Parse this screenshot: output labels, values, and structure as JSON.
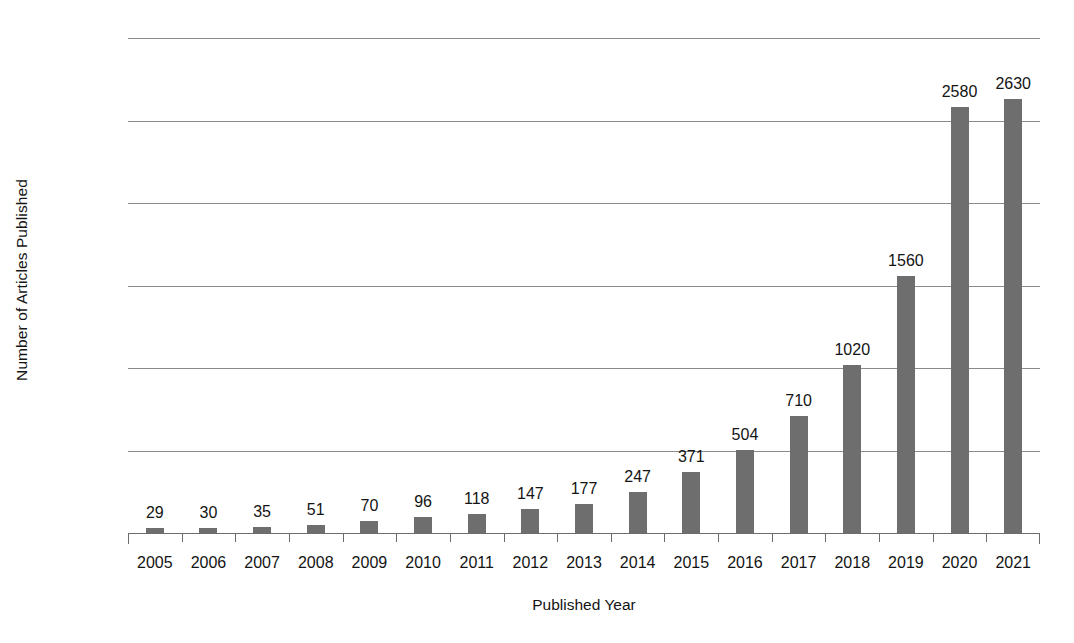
{
  "chart_data": {
    "type": "bar",
    "title": "",
    "xlabel": "Published Year",
    "ylabel": "Number of Articles Published",
    "categories": [
      "2005",
      "2006",
      "2007",
      "2008",
      "2009",
      "2010",
      "2011",
      "2012",
      "2013",
      "2014",
      "2015",
      "2016",
      "2017",
      "2018",
      "2019",
      "2020",
      "2021"
    ],
    "values": [
      29,
      30,
      35,
      51,
      70,
      96,
      118,
      147,
      177,
      247,
      371,
      504,
      710,
      1020,
      1560,
      2580,
      2630
    ],
    "value_labels": [
      "29",
      "30",
      "35",
      "51",
      "70",
      "96",
      "118",
      "147",
      "177",
      "247",
      "371",
      "504",
      "710",
      "1020",
      "1560",
      "2580",
      "2630"
    ],
    "ylim": [
      0,
      3000
    ],
    "ytick_values": [
      0,
      500,
      1000,
      1500,
      2000,
      2500,
      3000
    ],
    "ytick_labels": [
      "0",
      "500",
      "1000",
      "1500",
      "2000",
      "2500",
      "3000"
    ],
    "grid": "horizontal",
    "legend": "none",
    "bar_color": "#6e6e6e",
    "grid_color": "#8a8a8a",
    "axis_color": "#6b6b6b",
    "text_color": "#141414",
    "background": "#ffffff"
  }
}
